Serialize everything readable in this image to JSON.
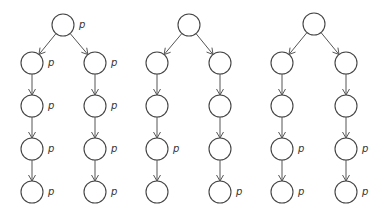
{
  "diagram": {
    "node_radius": 11,
    "colors": {
      "stroke": "#444444",
      "edge": "#555555",
      "label": "#333333",
      "background": "#ffffff"
    },
    "label_text": "p",
    "trees": [
      {
        "id": "tree-1",
        "nodes": [
          {
            "id": "t1-root",
            "x": 63,
            "y": 25,
            "label": "p"
          },
          {
            "id": "t1-l1",
            "x": 32,
            "y": 63,
            "label": "p"
          },
          {
            "id": "t1-l2",
            "x": 32,
            "y": 106,
            "label": "p"
          },
          {
            "id": "t1-l3",
            "x": 32,
            "y": 149,
            "label": "p"
          },
          {
            "id": "t1-l4",
            "x": 32,
            "y": 192,
            "label": "p"
          },
          {
            "id": "t1-r1",
            "x": 95,
            "y": 63,
            "label": "p"
          },
          {
            "id": "t1-r2",
            "x": 95,
            "y": 106,
            "label": "p"
          },
          {
            "id": "t1-r3",
            "x": 95,
            "y": 149,
            "label": "p"
          },
          {
            "id": "t1-r4",
            "x": 95,
            "y": 192,
            "label": "p"
          }
        ],
        "edges": [
          [
            "t1-root",
            "t1-l1"
          ],
          [
            "t1-l1",
            "t1-l2"
          ],
          [
            "t1-l2",
            "t1-l3"
          ],
          [
            "t1-l3",
            "t1-l4"
          ],
          [
            "t1-root",
            "t1-r1"
          ],
          [
            "t1-r1",
            "t1-r2"
          ],
          [
            "t1-r2",
            "t1-r3"
          ],
          [
            "t1-r3",
            "t1-r4"
          ]
        ]
      },
      {
        "id": "tree-2",
        "nodes": [
          {
            "id": "t2-root",
            "x": 189,
            "y": 25,
            "label": ""
          },
          {
            "id": "t2-l1",
            "x": 157,
            "y": 63,
            "label": ""
          },
          {
            "id": "t2-l2",
            "x": 157,
            "y": 106,
            "label": ""
          },
          {
            "id": "t2-l3",
            "x": 157,
            "y": 149,
            "label": "p"
          },
          {
            "id": "t2-l4",
            "x": 157,
            "y": 192,
            "label": ""
          },
          {
            "id": "t2-r1",
            "x": 220,
            "y": 63,
            "label": ""
          },
          {
            "id": "t2-r2",
            "x": 220,
            "y": 106,
            "label": ""
          },
          {
            "id": "t2-r3",
            "x": 220,
            "y": 149,
            "label": ""
          },
          {
            "id": "t2-r4",
            "x": 220,
            "y": 192,
            "label": "p"
          }
        ],
        "edges": [
          [
            "t2-root",
            "t2-l1"
          ],
          [
            "t2-l1",
            "t2-l2"
          ],
          [
            "t2-l2",
            "t2-l3"
          ],
          [
            "t2-l3",
            "t2-l4"
          ],
          [
            "t2-root",
            "t2-r1"
          ],
          [
            "t2-r1",
            "t2-r2"
          ],
          [
            "t2-r2",
            "t2-r3"
          ],
          [
            "t2-r3",
            "t2-r4"
          ]
        ]
      },
      {
        "id": "tree-3",
        "nodes": [
          {
            "id": "t3-root",
            "x": 314,
            "y": 24,
            "label": ""
          },
          {
            "id": "t3-l1",
            "x": 282,
            "y": 63,
            "label": ""
          },
          {
            "id": "t3-l2",
            "x": 282,
            "y": 106,
            "label": ""
          },
          {
            "id": "t3-l3",
            "x": 282,
            "y": 149,
            "label": "p"
          },
          {
            "id": "t3-l4",
            "x": 282,
            "y": 192,
            "label": "p"
          },
          {
            "id": "t3-r1",
            "x": 346,
            "y": 63,
            "label": ""
          },
          {
            "id": "t3-r2",
            "x": 346,
            "y": 106,
            "label": ""
          },
          {
            "id": "t3-r3",
            "x": 346,
            "y": 149,
            "label": "p"
          },
          {
            "id": "t3-r4",
            "x": 346,
            "y": 192,
            "label": "p"
          }
        ],
        "edges": [
          [
            "t3-root",
            "t3-l1"
          ],
          [
            "t3-l1",
            "t3-l2"
          ],
          [
            "t3-l2",
            "t3-l3"
          ],
          [
            "t3-l3",
            "t3-l4"
          ],
          [
            "t3-root",
            "t3-r1"
          ],
          [
            "t3-r1",
            "t3-r2"
          ],
          [
            "t3-r2",
            "t3-r3"
          ],
          [
            "t3-r3",
            "t3-r4"
          ]
        ]
      }
    ]
  }
}
